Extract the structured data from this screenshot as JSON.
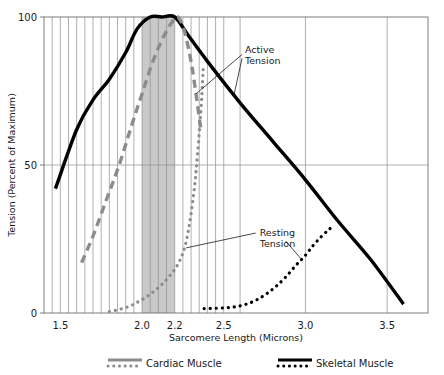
{
  "chart_data": {
    "type": "line",
    "title": "",
    "xlabel": "Sarcomere Length (Microns)",
    "ylabel": "Tension (Percent of Maximum)",
    "xlim": [
      1.4,
      3.75
    ],
    "ylim": [
      0,
      100
    ],
    "grid": true,
    "xticks_labeled": [
      "1.5",
      "2.0",
      "2.2",
      "2.5",
      "3.0",
      "3.5"
    ],
    "xtick_values": [
      1.5,
      2.0,
      2.2,
      2.5,
      3.0,
      3.5
    ],
    "yticks_labeled": [
      "0",
      "50",
      "100"
    ],
    "ytick_values": [
      0,
      50,
      100
    ],
    "legend_position": "below-axes",
    "shaded_band": {
      "label": "optimal sarcomere length range",
      "x_start": 2.0,
      "x_end": 2.2,
      "color": "#c9c9c9"
    },
    "series": [
      {
        "name": "Skeletal Muscle Active Tension",
        "style": "solid",
        "color": "#000000",
        "width": 3.4,
        "x": [
          1.47,
          1.6,
          1.7,
          1.8,
          1.9,
          1.97,
          2.05,
          2.12,
          2.2,
          2.28,
          2.4,
          2.6,
          2.8,
          3.0,
          3.2,
          3.4,
          3.6
        ],
        "y": [
          42,
          62,
          72,
          79,
          88,
          96,
          100,
          100,
          100,
          94,
          85,
          71,
          58,
          45,
          31,
          18,
          3
        ]
      },
      {
        "name": "Skeletal Muscle Resting Tension",
        "style": "dotted",
        "color": "#000000",
        "width": 3.2,
        "x": [
          2.38,
          2.45,
          2.52,
          2.58,
          2.64,
          2.7,
          2.76,
          2.82,
          2.88,
          2.94,
          3.0,
          3.05,
          3.1,
          3.14,
          3.17
        ],
        "y": [
          1.5,
          1.6,
          1.8,
          2.2,
          3.0,
          4.4,
          6.4,
          9.0,
          12.2,
          16.0,
          19.5,
          23.0,
          26.0,
          28.0,
          29.5
        ]
      },
      {
        "name": "Cardiac Muscle Active Tension",
        "style": "dashed",
        "color": "#8c8c8c",
        "width": 3.4,
        "x": [
          1.63,
          1.7,
          1.78,
          1.86,
          1.94,
          2.0,
          2.06,
          2.12,
          2.18,
          2.22,
          2.26,
          2.3,
          2.33,
          2.36
        ],
        "y": [
          17,
          26,
          38,
          50,
          64,
          74,
          84,
          92,
          98,
          100,
          95,
          85,
          74,
          62
        ]
      },
      {
        "name": "Cardiac Muscle Resting Tension",
        "style": "dotted",
        "color": "#8c8c8c",
        "width": 3.2,
        "x": [
          1.8,
          1.86,
          1.92,
          1.97,
          2.02,
          2.07,
          2.12,
          2.17,
          2.22,
          2.26,
          2.29,
          2.32,
          2.34,
          2.36,
          2.37,
          2.375
        ],
        "y": [
          0.5,
          1.2,
          2.2,
          3.6,
          5.2,
          7.2,
          9.6,
          12.6,
          16.5,
          22.0,
          30.0,
          42.0,
          54.0,
          68.0,
          78.0,
          84.0
        ]
      }
    ],
    "annotations": [
      {
        "text_line1": "Active",
        "text_line2": "Tension",
        "x": 2.63,
        "y": 88
      },
      {
        "text_line1": "Resting",
        "text_line2": "Tension",
        "x": 2.72,
        "y": 26
      }
    ],
    "legend": [
      {
        "label": "Cardiac Muscle",
        "color": "#8c8c8c"
      },
      {
        "label": "Skeletal Muscle",
        "color": "#000000"
      }
    ]
  }
}
